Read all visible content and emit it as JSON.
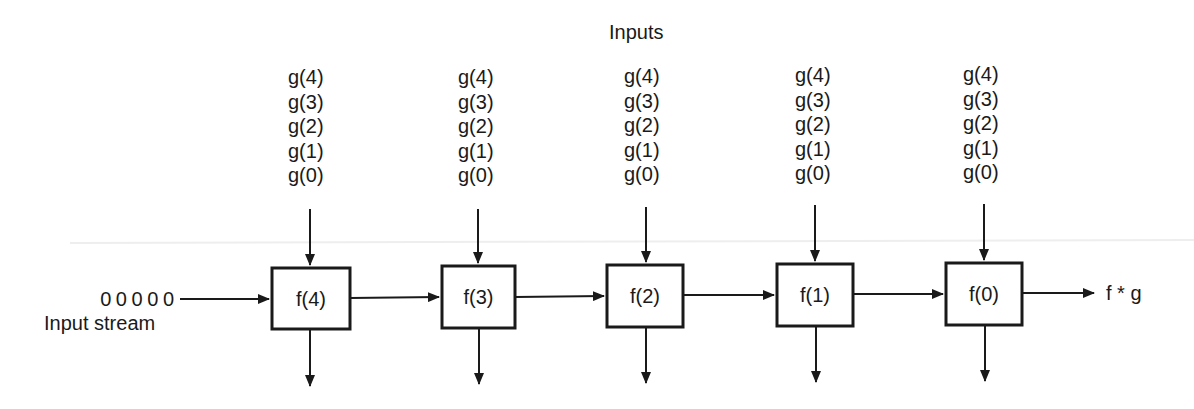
{
  "title": "Inputs",
  "input_stream": {
    "values": "0 0 0 0 0",
    "label": "Input stream"
  },
  "output_label": "f * g",
  "cells": [
    {
      "label": "f(4)",
      "inputs": [
        "g(4)",
        "g(3)",
        "g(2)",
        "g(1)",
        "g(0)"
      ]
    },
    {
      "label": "f(3)",
      "inputs": [
        "g(4)",
        "g(3)",
        "g(2)",
        "g(1)",
        "g(0)"
      ]
    },
    {
      "label": "f(2)",
      "inputs": [
        "g(4)",
        "g(3)",
        "g(2)",
        "g(1)",
        "g(0)"
      ]
    },
    {
      "label": "f(1)",
      "inputs": [
        "g(4)",
        "g(3)",
        "g(2)",
        "g(1)",
        "g(0)"
      ]
    },
    {
      "label": "f(0)",
      "inputs": [
        "g(4)",
        "g(3)",
        "g(2)",
        "g(1)",
        "g(0)"
      ]
    }
  ],
  "colors": {
    "stroke": "#1a1a1a",
    "background": "#ffffff"
  }
}
